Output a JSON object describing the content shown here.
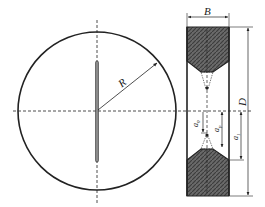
{
  "figure": {
    "colors": {
      "line": "#222222",
      "hatch_fill": "#5a5a5a",
      "rod_fill": "#8a8a8a",
      "background": "#ffffff"
    },
    "front_view": {
      "center": [
        97,
        111
      ],
      "radius": 80,
      "radius_label": "R"
    },
    "section_view": {
      "x": 187,
      "y": 27,
      "width": 42,
      "height": 169,
      "width_label": "B",
      "height_label": "D",
      "dims": {
        "a0": "a",
        "a0_sub": "0",
        "ap": "a",
        "ap_sub": "p",
        "a1": "a",
        "a1_sub": "1"
      }
    }
  }
}
